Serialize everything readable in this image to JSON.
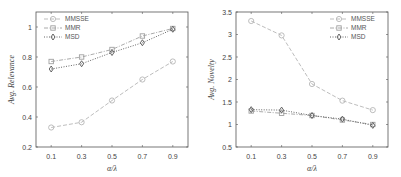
{
  "chart_data": [
    {
      "type": "line",
      "title": "",
      "xlabel": "α/λ",
      "ylabel": "Avg. Relevance",
      "x": [
        0.1,
        0.3,
        0.5,
        0.7,
        0.9
      ],
      "xticks": [
        "0.1",
        "0.3",
        "0.5",
        "0.7",
        "0.9"
      ],
      "xlim": [
        0.0,
        1.0
      ],
      "ylim": [
        0.2,
        1.1
      ],
      "yticks": [
        "0.2",
        "0.4",
        "0.6",
        "0.8",
        "1"
      ],
      "yticks_values": [
        0.2,
        0.4,
        0.6,
        0.8,
        1.0
      ],
      "grid": false,
      "legend_position": "upper left",
      "series": [
        {
          "name": "MMSSE",
          "marker": "circle",
          "dash": "dashed",
          "color": "#b5b5b5",
          "values": [
            0.33,
            0.365,
            0.51,
            0.65,
            0.77
          ]
        },
        {
          "name": "MMR",
          "marker": "square",
          "dash": "dashdot",
          "color": "#a0a0a0",
          "values": [
            0.77,
            0.8,
            0.85,
            0.94,
            0.99
          ]
        },
        {
          "name": "MSD",
          "marker": "diamond",
          "dash": "dotted",
          "color": "#555555",
          "values": [
            0.72,
            0.755,
            0.83,
            0.895,
            0.985
          ]
        }
      ]
    },
    {
      "type": "line",
      "title": "",
      "xlabel": "α/λ",
      "ylabel": "Avg. Novelty",
      "x": [
        0.1,
        0.3,
        0.5,
        0.7,
        0.9
      ],
      "xticks": [
        "0.1",
        "0.3",
        "0.5",
        "0.7",
        "0.9"
      ],
      "xlim": [
        0.0,
        1.0
      ],
      "ylim": [
        0.5,
        3.5
      ],
      "yticks": [
        "0.5",
        "1",
        "1.5",
        "2",
        "2.5",
        "3",
        "3.5"
      ],
      "yticks_values": [
        0.5,
        1.0,
        1.5,
        2.0,
        2.5,
        3.0,
        3.5
      ],
      "grid": false,
      "legend_position": "upper right",
      "series": [
        {
          "name": "MMSSE",
          "marker": "circle",
          "dash": "dashed",
          "color": "#b5b5b5",
          "values": [
            3.3,
            2.98,
            1.9,
            1.53,
            1.32
          ]
        },
        {
          "name": "MMR",
          "marker": "square",
          "dash": "dashdot",
          "color": "#a0a0a0",
          "values": [
            1.3,
            1.25,
            1.2,
            1.1,
            1.0
          ]
        },
        {
          "name": "MSD",
          "marker": "diamond",
          "dash": "dotted",
          "color": "#555555",
          "values": [
            1.33,
            1.32,
            1.2,
            1.12,
            0.98
          ]
        }
      ]
    }
  ],
  "labels": {
    "left_ylabel": "Avg. Relevance",
    "right_ylabel": "Avg. Novelty",
    "xlabel": "α/λ"
  }
}
